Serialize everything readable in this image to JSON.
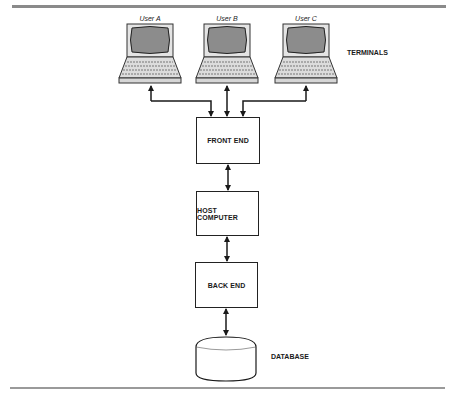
{
  "diagram": {
    "terminals": {
      "label": "TERMINALS",
      "users": [
        {
          "label": "User A"
        },
        {
          "label": "User B"
        },
        {
          "label": "User C"
        }
      ]
    },
    "nodes": [
      {
        "id": "front_end",
        "label": "FRONT END"
      },
      {
        "id": "host_computer",
        "label": "HOST COMPUTER"
      },
      {
        "id": "back_end",
        "label": "BACK END"
      }
    ],
    "database": {
      "label": "DATABASE"
    },
    "edges": [
      {
        "from": "User A",
        "to": "FRONT END",
        "direction": "bidirectional"
      },
      {
        "from": "User B",
        "to": "FRONT END",
        "direction": "bidirectional"
      },
      {
        "from": "User C",
        "to": "FRONT END",
        "direction": "bidirectional"
      },
      {
        "from": "FRONT END",
        "to": "HOST COMPUTER",
        "direction": "bidirectional"
      },
      {
        "from": "HOST COMPUTER",
        "to": "BACK END",
        "direction": "bidirectional"
      },
      {
        "from": "BACK END",
        "to": "DATABASE",
        "direction": "bidirectional"
      }
    ],
    "colors": {
      "screen": "#8c8c8c",
      "laptop_body": "#e2e2e2",
      "line": "#1a1a1a",
      "rule": "#8a8a8a"
    }
  }
}
